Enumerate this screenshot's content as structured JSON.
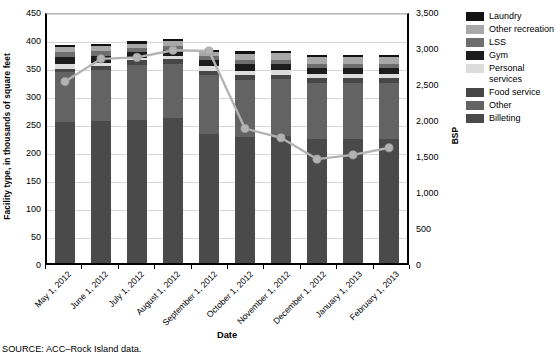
{
  "axes": {
    "y_left_title": "Facility type, in thousands of square feet",
    "y_right_title": "BSP",
    "x_title": "Date",
    "y_left_ticks": [
      "0",
      "50",
      "100",
      "150",
      "200",
      "250",
      "300",
      "350",
      "400",
      "450"
    ],
    "y_right_ticks": [
      "0",
      "500",
      "1,000",
      "1,500",
      "2,000",
      "2,500",
      "3,000",
      "3,500"
    ]
  },
  "legend": {
    "items": [
      {
        "label": "Laundry",
        "color": "#121212"
      },
      {
        "label": "Other recreation",
        "color": "#a8a8a8"
      },
      {
        "label": "LSS",
        "color": "#6e6e6e"
      },
      {
        "label": "Gym",
        "color": "#1c1c1c"
      },
      {
        "label": "Personal services",
        "color": "#dcdcdc"
      },
      {
        "label": "Food service",
        "color": "#474747"
      },
      {
        "label": "Other",
        "color": "#636363"
      },
      {
        "label": "Billeting",
        "color": "#4a4a4a"
      }
    ]
  },
  "source": "SOURCE: ACC–Rock Island data.",
  "chart_data": {
    "type": "bar",
    "title": "",
    "xlabel": "Date",
    "ylabel": "Facility type, in thousands of square feet",
    "y2label": "BSP",
    "ylim": [
      0,
      450
    ],
    "y2lim": [
      0,
      3500
    ],
    "grid": true,
    "legend_position": "right",
    "stacked": true,
    "categories": [
      "May 1, 2012",
      "June 1, 2012",
      "July 1, 2012",
      "August 1, 2012",
      "September 1, 2012",
      "October 1, 2012",
      "November 1, 2012",
      "December 1, 2012",
      "January 1, 2013",
      "February 1, 2013"
    ],
    "series": [
      {
        "name": "Billeting",
        "color": "#4a4a4a",
        "values": [
          252,
          254,
          256,
          259,
          230,
          225,
          226,
          221,
          221,
          222
        ]
      },
      {
        "name": "Other",
        "color": "#636363",
        "values": [
          89,
          90,
          98,
          97,
          105,
          102,
          102,
          101,
          101,
          100
        ]
      },
      {
        "name": "Food service",
        "color": "#474747",
        "values": [
          5,
          8,
          8,
          8,
          8,
          8,
          8,
          8,
          8,
          8
        ]
      },
      {
        "name": "Personal services",
        "color": "#dcdcdc",
        "values": [
          10,
          6,
          5,
          5,
          8,
          8,
          8,
          8,
          8,
          8
        ]
      },
      {
        "name": "Gym",
        "color": "#1c1c1c",
        "values": [
          12,
          12,
          10,
          12,
          12,
          12,
          12,
          11,
          11,
          11
        ]
      },
      {
        "name": "LSS",
        "color": "#6e6e6e",
        "values": [
          8,
          8,
          7,
          7,
          6,
          7,
          7,
          7,
          7,
          7
        ]
      },
      {
        "name": "Other recreation",
        "color": "#a8a8a8",
        "values": [
          10,
          10,
          8,
          8,
          7,
          12,
          12,
          12,
          12,
          12
        ]
      },
      {
        "name": "Laundry",
        "color": "#121212",
        "values": [
          4,
          4,
          4,
          5,
          4,
          4,
          4,
          4,
          4,
          4
        ]
      }
    ],
    "line_series": {
      "name": "BSP",
      "color": "#b3b3b3",
      "axis": "right",
      "values": [
        2550,
        2870,
        2890,
        2990,
        2980,
        1890,
        1760,
        1460,
        1520,
        1620
      ]
    }
  }
}
